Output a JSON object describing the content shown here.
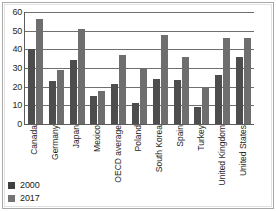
{
  "chart_data": {
    "type": "bar",
    "title": "",
    "subtitle": "",
    "xlabel": "",
    "ylabel": "",
    "ylim": [
      0,
      60
    ],
    "ytick_step": 10,
    "yticks": [
      "60",
      "50",
      "40",
      "30",
      "20",
      "10",
      "0"
    ],
    "grid": true,
    "legend_position": "bottom-left",
    "categories": [
      "Canada",
      "Germany",
      "Japan",
      "Mexico",
      "OECD average",
      "Poland",
      "South Korea",
      "Spain",
      "Turkey",
      "United Kingdom",
      "United States"
    ],
    "series": [
      {
        "name": "2000",
        "color": "#4d4d4d",
        "values": [
          40,
          23,
          34.5,
          15,
          21.5,
          11.5,
          24,
          23.5,
          9,
          26,
          36
        ]
      },
      {
        "name": "2017",
        "color": "#6e6e6e",
        "values": [
          56.5,
          29,
          51,
          17.5,
          37,
          30,
          47.5,
          36,
          20,
          46,
          46
        ]
      }
    ]
  },
  "legend": {
    "entries": [
      {
        "label": "2000"
      },
      {
        "label": "2017"
      }
    ]
  },
  "colors": {
    "series_2000": "#4d4d4d",
    "series_2017": "#6e6e6e",
    "axis": "#5c5c5c",
    "gridline": "#6f6f6f",
    "frame": "#a8a8a8",
    "background": "#ffffff"
  }
}
